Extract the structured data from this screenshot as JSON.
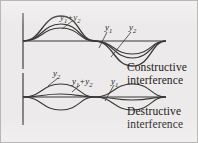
{
  "figure": {
    "background_color": "#eceaea",
    "border_color": "#b9b7b6",
    "curve_color": "#3a3736",
    "axis_color": "#6d6a69",
    "text_color": "#1d1b1b"
  },
  "captions": {
    "constructive": {
      "line1": "Constructive",
      "line2": "interference"
    },
    "destructive": {
      "line1": "Destructive",
      "line2": "interference"
    }
  },
  "labels": {
    "y1": {
      "base": "y",
      "sub": "1"
    },
    "y2": {
      "base": "y",
      "sub": "2"
    },
    "sum_plus": "+"
  },
  "panels": [
    {
      "name": "constructive",
      "phase_relation": "in phase",
      "axis_x": 22,
      "baseline_y": 40,
      "wave_start_x": 22,
      "wave_end_x": 165,
      "periods": 1,
      "curves": [
        {
          "name": "y1",
          "amplitude": 17,
          "phase_deg": 0
        },
        {
          "name": "y2",
          "amplitude": 13,
          "phase_deg": 0
        },
        {
          "name": "y1+y2",
          "amplitude": 25,
          "phase_deg": 0
        }
      ],
      "leaders": [
        {
          "label": "y1+y2",
          "from_x": 72,
          "from_y": 20,
          "to_x": 62,
          "to_y": 27
        },
        {
          "label": "y1",
          "from_x": 106,
          "from_y": 32,
          "to_x": 98,
          "to_y": 47
        },
        {
          "label": "y2",
          "from_x": 130,
          "from_y": 32,
          "to_x": 110,
          "to_y": 55
        }
      ]
    },
    {
      "name": "destructive",
      "phase_relation": "out of phase by 180 degrees",
      "axis_x": 22,
      "baseline_y": 96,
      "wave_start_x": 22,
      "wave_end_x": 165,
      "periods": 1,
      "curves": [
        {
          "name": "y1",
          "amplitude": 13,
          "phase_deg": 0
        },
        {
          "name": "y2",
          "amplitude": 13,
          "phase_deg": 180
        },
        {
          "name": "y1+y2",
          "amplitude": 3,
          "phase_deg": 0
        }
      ],
      "leaders": [
        {
          "label": "y2",
          "from_x": 57,
          "from_y": 77,
          "to_x": 47,
          "to_y": 84
        },
        {
          "label": "y1+y2",
          "from_x": 80,
          "from_y": 85,
          "to_x": 70,
          "to_y": 90
        },
        {
          "label": "y1",
          "from_x": 113,
          "from_y": 85,
          "to_x": 104,
          "to_y": 100
        }
      ]
    }
  ]
}
